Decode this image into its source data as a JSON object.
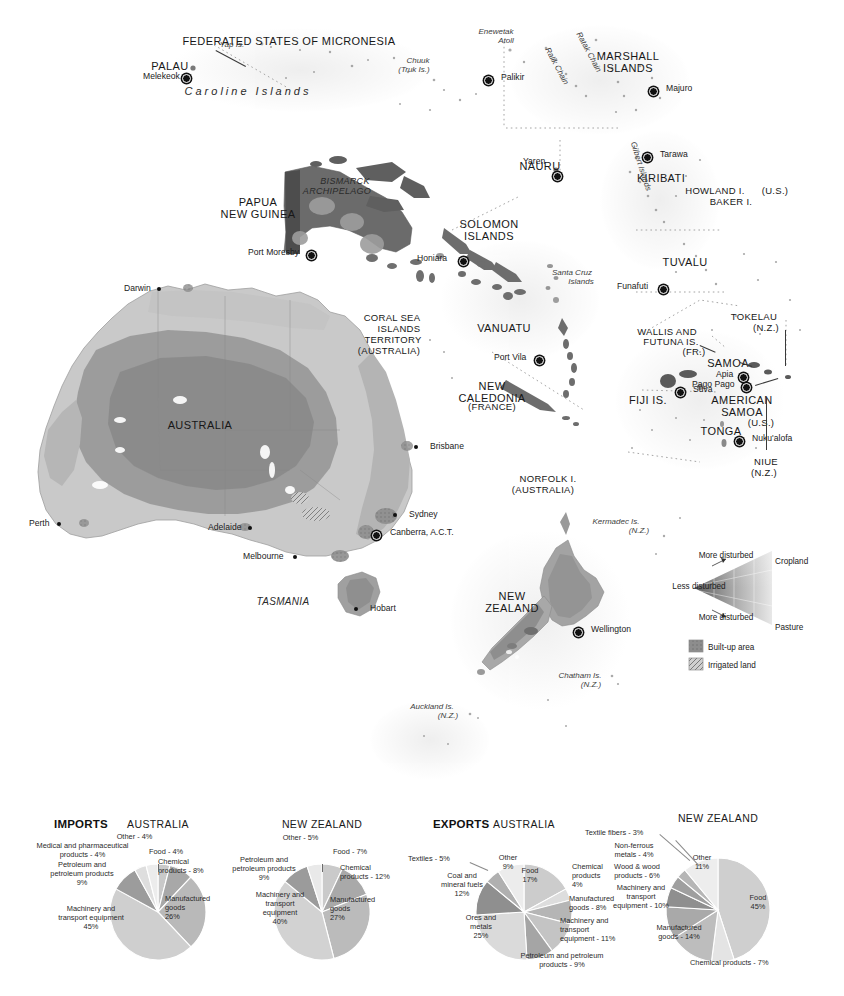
{
  "map": {
    "title": "Oceania reference map",
    "countries": [
      {
        "name": "PALAU",
        "x": 170,
        "y": 60,
        "cls": "country"
      },
      {
        "name": "FEDERATED STATES OF MICRONESIA",
        "x": 289,
        "y": 35,
        "cls": "country"
      },
      {
        "name": "MARSHALL ISLANDS",
        "x": 628,
        "y": 50,
        "cls": "country"
      },
      {
        "name": "NAURU",
        "x": 540,
        "y": 160,
        "cls": "country"
      },
      {
        "name": "KIRIBATI",
        "x": 661,
        "y": 172,
        "cls": "country"
      },
      {
        "name": "PAPUA NEW GUINEA",
        "x": 258,
        "y": 196,
        "cls": "country"
      },
      {
        "name": "SOLOMON ISLANDS",
        "x": 489,
        "y": 218,
        "cls": "country"
      },
      {
        "name": "TUVALU",
        "x": 685,
        "y": 256,
        "cls": "country"
      },
      {
        "name": "VANUATU",
        "x": 504,
        "y": 322,
        "cls": "country"
      },
      {
        "name": "SAMOA",
        "x": 728,
        "y": 357,
        "cls": "country"
      },
      {
        "name": "FIJI IS.",
        "x": 648,
        "y": 394,
        "cls": "country"
      },
      {
        "name": "AMERICAN SAMOA",
        "x": 742,
        "y": 394,
        "cls": "country"
      },
      {
        "name": "TONGA",
        "x": 721,
        "y": 425,
        "cls": "country"
      },
      {
        "name": "NEW CALEDONIA",
        "x": 492,
        "y": 380,
        "cls": "country"
      },
      {
        "name": "AUSTRALIA",
        "x": 200,
        "y": 419,
        "cls": "country"
      },
      {
        "name": "NEW ZEALAND",
        "x": 512,
        "y": 590,
        "cls": "country"
      }
    ],
    "sublabels": [
      {
        "name": "(FRANCE)",
        "x": 492,
        "y": 402
      },
      {
        "name": "(U.S.)",
        "x": 761,
        "y": 418
      }
    ],
    "territories": [
      {
        "name": "HOWLAND I.",
        "x": 715,
        "y": 186
      },
      {
        "name": "(U.S.)",
        "x": 775,
        "y": 186
      },
      {
        "name": "BAKER I.",
        "x": 731,
        "y": 197
      },
      {
        "name": "TOKELAU",
        "x": 754,
        "y": 312
      },
      {
        "name": "(N.Z.)",
        "x": 766,
        "y": 323
      },
      {
        "name": "WALLIS AND",
        "x": 667,
        "y": 327
      },
      {
        "name": "FUTUNA IS.",
        "x": 671,
        "y": 337
      },
      {
        "name": "(FR.)",
        "x": 694,
        "y": 347
      },
      {
        "name": "NIUE",
        "x": 766,
        "y": 457
      },
      {
        "name": "(N.Z.)",
        "x": 764,
        "y": 468
      },
      {
        "name": "CORAL SEA",
        "x": 392,
        "y": 313
      },
      {
        "name": "ISLANDS",
        "x": 399,
        "y": 324
      },
      {
        "name": "TERRITORY",
        "x": 393,
        "y": 335
      },
      {
        "name": "(AUSTRALIA)",
        "x": 389,
        "y": 346
      },
      {
        "name": "NORFOLK I.",
        "x": 548,
        "y": 474
      },
      {
        "name": "(AUSTRALIA)",
        "x": 543,
        "y": 485
      }
    ],
    "cities": [
      {
        "name": "Melekeok",
        "x": 182,
        "y": 74,
        "dx": 39,
        "dy": 4,
        "type": "capital",
        "align": "right"
      },
      {
        "name": "Palikir",
        "x": 484,
        "y": 76,
        "dx": -7,
        "dy": 3,
        "type": "capital",
        "align": "left"
      },
      {
        "name": "Majuro",
        "x": 649,
        "y": 87,
        "dx": -7,
        "dy": 3,
        "type": "capital",
        "align": "left"
      },
      {
        "name": "Yaren",
        "x": 553,
        "y": 172,
        "dx": 30,
        "dy": -9,
        "type": "capital",
        "align": "right"
      },
      {
        "name": "Tarawa",
        "x": 643,
        "y": 153,
        "dx": -7,
        "dy": 3,
        "type": "capital",
        "align": "left"
      },
      {
        "name": "Port Moresby",
        "x": 307,
        "y": 251,
        "dx": 59,
        "dy": 3,
        "type": "capital",
        "align": "right"
      },
      {
        "name": "Honiara",
        "x": 459,
        "y": 257,
        "dx": 42,
        "dy": 3,
        "type": "capital",
        "align": "right"
      },
      {
        "name": "Funafuti",
        "x": 659,
        "y": 285,
        "dx": 42,
        "dy": 3,
        "type": "capital",
        "align": "right"
      },
      {
        "name": "Port Vila",
        "x": 535,
        "y": 356,
        "dx": 41,
        "dy": 3,
        "type": "capital",
        "align": "right"
      },
      {
        "name": "Suva",
        "x": 676,
        "y": 388,
        "dx": -7,
        "dy": 3,
        "type": "capital",
        "align": "left"
      },
      {
        "name": "Apia",
        "x": 739,
        "y": 373,
        "dx": 23,
        "dy": 3,
        "type": "capital",
        "align": "right"
      },
      {
        "name": "Pago Pago",
        "x": 742,
        "y": 383,
        "dx": 50,
        "dy": 3,
        "type": "capital",
        "align": "right"
      },
      {
        "name": "Nuku'alofa",
        "x": 735,
        "y": 437,
        "dx": -7,
        "dy": 3,
        "type": "capital",
        "align": "left"
      },
      {
        "name": "Wellington",
        "x": 574,
        "y": 628,
        "dx": -7,
        "dy": 3,
        "type": "capital",
        "align": "left"
      },
      {
        "name": "Darwin",
        "x": 157,
        "y": 287,
        "dx": 33,
        "dy": 3,
        "type": "city",
        "align": "right"
      },
      {
        "name": "Brisbane",
        "x": 414,
        "y": 445,
        "dx": -6,
        "dy": 3,
        "type": "city",
        "align": "left"
      },
      {
        "name": "Perth",
        "x": 57,
        "y": 522,
        "dx": 28,
        "dy": 3,
        "type": "city",
        "align": "right"
      },
      {
        "name": "Sydney",
        "x": 393,
        "y": 513,
        "dx": -6,
        "dy": 3,
        "type": "city",
        "align": "left"
      },
      {
        "name": "Adelaide",
        "x": 248,
        "y": 526,
        "dx": 40,
        "dy": 3,
        "type": "city",
        "align": "right"
      },
      {
        "name": "Canberra, A.C.T.",
        "x": 372,
        "y": 531,
        "dx": -8,
        "dy": 3,
        "type": "capital",
        "align": "left"
      },
      {
        "name": "Melbourne",
        "x": 293,
        "y": 555,
        "dx": 50,
        "dy": 3,
        "type": "city",
        "align": "right"
      },
      {
        "name": "Hobart",
        "x": 354,
        "y": 607,
        "dx": -6,
        "dy": 3,
        "type": "city",
        "align": "left"
      }
    ],
    "physical": [
      {
        "name": "Yap Is.",
        "x": 232,
        "y": 41,
        "cls": "isl"
      },
      {
        "name": "Chuuk",
        "x": 418,
        "y": 57,
        "cls": "isl"
      },
      {
        "name": "(Truk Is.)",
        "x": 414,
        "y": 66,
        "cls": "isl"
      },
      {
        "name": "Enewetak",
        "x": 496,
        "y": 28,
        "cls": "isl"
      },
      {
        "name": "Atoll",
        "x": 506,
        "y": 37,
        "cls": "isl"
      },
      {
        "name": "Caroline Islands",
        "x": 248,
        "y": 85,
        "cls": "isl-b"
      },
      {
        "name": "Ralik Chain",
        "x": 556,
        "y": 62,
        "cls": "isl"
      },
      {
        "name": "Ratak Chain",
        "x": 588,
        "y": 48,
        "cls": "isl"
      },
      {
        "name": "Gilbert Islands",
        "x": 640,
        "y": 162,
        "cls": "isl"
      },
      {
        "name": "BISMARCK",
        "x": 345,
        "y": 176,
        "cls": "isl-b"
      },
      {
        "name": "ARCHIPELAGO",
        "x": 337,
        "y": 186,
        "cls": "isl-b"
      },
      {
        "name": "Santa Cruz",
        "x": 572,
        "y": 269,
        "cls": "isl"
      },
      {
        "name": "Islands",
        "x": 581,
        "y": 278,
        "cls": "isl"
      },
      {
        "name": "TASMANIA",
        "x": 283,
        "y": 596,
        "cls": "isl-b"
      },
      {
        "name": "Kermadec Is.",
        "x": 616,
        "y": 518,
        "cls": "isl"
      },
      {
        "name": "(N.Z.)",
        "x": 639,
        "y": 527,
        "cls": "isl"
      },
      {
        "name": "Chatham Is.",
        "x": 580,
        "y": 672,
        "cls": "isl"
      },
      {
        "name": "(N.Z.)",
        "x": 591,
        "y": 681,
        "cls": "isl"
      },
      {
        "name": "Auckland Is.",
        "x": 432,
        "y": 703,
        "cls": "isl"
      },
      {
        "name": "(N.Z.)",
        "x": 448,
        "y": 712,
        "cls": "isl"
      }
    ],
    "legend": {
      "more_disturbed_top": "More\ndisturbed",
      "more_disturbed_bottom": "More\ndisturbed",
      "less_disturbed": "Less\ndisturbed",
      "cropland": "Cropland",
      "pasture": "Pasture",
      "swatches": [
        {
          "label": "Built-up area",
          "color": "#8d8d8d"
        },
        {
          "label": "Irrigated land",
          "color": "#bcbcbc"
        }
      ]
    }
  },
  "chart_data": [
    {
      "type": "pie",
      "title": "AUSTRALIA",
      "group": "IMPORTS",
      "cx": 158,
      "cy": 112,
      "r": 48,
      "start_angle": -90,
      "categories": [
        "Food - 4%",
        "Chemical products - 8%",
        "Manufactured goods 26%",
        "Machinery and transport equipment 45%",
        "Petroleum and petroleum products 9%",
        "Medical and pharmaceutical products - 4%",
        "Other - 4%"
      ],
      "values": [
        4,
        8,
        26,
        45,
        9,
        4,
        4
      ],
      "colors": [
        "#c9c9c9",
        "#a8a8a8",
        "#b9b9b9",
        "#cfcfcf",
        "#9c9c9c",
        "#dedede",
        "#ececec"
      ],
      "labels": [
        {
          "text": "Food - 4%",
          "x": 149,
          "y": 47,
          "w": 60,
          "align": "left"
        },
        {
          "text": "Chemical\nproducts - 8%",
          "x": 158,
          "y": 57,
          "w": 72,
          "align": "left"
        },
        {
          "text": "Manufactured\ngoods\n26%",
          "x": 165,
          "y": 94,
          "w": 70,
          "align": "left"
        },
        {
          "text": "Machinery and\ntransport equipment\n45%",
          "x": 36,
          "y": 104,
          "w": 110,
          "align": "center"
        },
        {
          "text": "Petroleum and\npetroleum products\n9%",
          "x": 30,
          "y": 60,
          "w": 104,
          "align": "center"
        },
        {
          "text": "Medical and pharmaceutical\nproducts - 4%",
          "x": 5,
          "y": 41,
          "w": 155,
          "align": "center"
        },
        {
          "text": "Other - 4%",
          "x": 102,
          "y": 32,
          "w": 65,
          "align": "center"
        }
      ]
    },
    {
      "type": "pie",
      "title": "NEW ZEALAND",
      "group": "IMPORTS",
      "cx": 322,
      "cy": 112,
      "r": 48,
      "start_angle": -90,
      "categories": [
        "Food - 7%",
        "Chemical products - 12%",
        "Manufactured goods 27%",
        "Machinery and transport equipment 40%",
        "Petroleum and petroleum products 9%",
        "Other - 5%"
      ],
      "values": [
        7,
        12,
        27,
        40,
        9,
        5
      ],
      "colors": [
        "#cacaca",
        "#a9a9a9",
        "#bbbbbb",
        "#d2d2d2",
        "#9b9b9b",
        "#e9e9e9"
      ],
      "labels": [
        {
          "text": "Food - 7%",
          "x": 333,
          "y": 47,
          "w": 60,
          "align": "left"
        },
        {
          "text": "Chemical\nproducts - 12%",
          "x": 340,
          "y": 63,
          "w": 76,
          "align": "left"
        },
        {
          "text": "Manufactured\ngoods\n27%",
          "x": 330,
          "y": 95,
          "w": 70,
          "align": "left"
        },
        {
          "text": "Machinery and\ntransport\nequipment\n40%",
          "x": 240,
          "y": 90,
          "w": 80,
          "align": "center"
        },
        {
          "text": "Petroleum and\npetroleum products\n9%",
          "x": 212,
          "y": 55,
          "w": 104,
          "align": "center"
        },
        {
          "text": "Other - 5%",
          "x": 268,
          "y": 33,
          "w": 65,
          "align": "center"
        }
      ]
    },
    {
      "type": "pie",
      "title": "AUSTRALIA",
      "group": "EXPORTS",
      "cx": 524,
      "cy": 112,
      "r": 48,
      "start_angle": -90,
      "categories": [
        "Food 17%",
        "Chemical products 4%",
        "Manufactured goods - 8%",
        "Machinery and transport equipment - 11%",
        "Petroleum and petroleum products - 9%",
        "Ores and metals 25%",
        "Coal and mineral fuels 12%",
        "Textiles - 5%",
        "Other 9%"
      ],
      "values": [
        17,
        4,
        8,
        11,
        9,
        25,
        12,
        5,
        9
      ],
      "colors": [
        "#cccccc",
        "#dddddd",
        "#b5b5b5",
        "#c4c4c4",
        "#a5a5a5",
        "#dadada",
        "#8f8f8f",
        "#b0b0b0",
        "#ececec"
      ],
      "labels": [
        {
          "text": "Food\n17%",
          "x": 508,
          "y": 66,
          "w": 44,
          "align": "center"
        },
        {
          "text": "Chemical\nproducts\n4%",
          "x": 572,
          "y": 62,
          "w": 58,
          "align": "left"
        },
        {
          "text": "Manufactured\ngoods - 8%",
          "x": 569,
          "y": 94,
          "w": 78,
          "align": "left"
        },
        {
          "text": "Machinery and\ntransport\nequipment - 11%",
          "x": 560,
          "y": 116,
          "w": 86,
          "align": "left"
        },
        {
          "text": "Petroleum and petroleum\nproducts - 9%",
          "x": 497,
          "y": 151,
          "w": 130,
          "align": "center"
        },
        {
          "text": "Ores and\nmetals\n25%",
          "x": 450,
          "y": 113,
          "w": 62,
          "align": "center"
        },
        {
          "text": "Coal and\nmineral fuels\n12%",
          "x": 424,
          "y": 71,
          "w": 76,
          "align": "center"
        },
        {
          "text": "Textiles - 5%",
          "x": 408,
          "y": 54,
          "w": 62,
          "align": "left"
        },
        {
          "text": "Other\n9%",
          "x": 487,
          "y": 53,
          "w": 42,
          "align": "center"
        }
      ]
    },
    {
      "type": "pie",
      "title": "NEW ZEALAND",
      "group": "EXPORTS",
      "cx": 718,
      "cy": 110,
      "r": 52,
      "start_angle": -90,
      "categories": [
        "Food 45%",
        "Chemical products - 7%",
        "Manufactured goods - 14%",
        "Machinery and transport equipment - 10%",
        "Wood & wood products - 6%",
        "Non-ferrous metals - 4%",
        "Textile fibers - 3%",
        "Other 11%"
      ],
      "values": [
        45,
        7,
        14,
        10,
        6,
        4,
        3,
        11
      ],
      "colors": [
        "#cfcfcf",
        "#e4e4e4",
        "#bdbdbd",
        "#a9a9a9",
        "#8f8f8f",
        "#9f9f9f",
        "#b6b6b6",
        "#ededed"
      ],
      "labels": [
        {
          "text": "Food\n45%",
          "x": 736,
          "y": 93,
          "w": 44,
          "align": "center"
        },
        {
          "text": "Chemical products - 7%",
          "x": 690,
          "y": 158,
          "w": 130,
          "align": "left"
        },
        {
          "text": "Manufactured\ngoods - 14%",
          "x": 639,
          "y": 123,
          "w": 80,
          "align": "center"
        },
        {
          "text": "Machinery and\ntransport\nequipment - 10%",
          "x": 596,
          "y": 83,
          "w": 90,
          "align": "center"
        },
        {
          "text": "Wood & wood\nproducts - 6%",
          "x": 597,
          "y": 62,
          "w": 80,
          "align": "center"
        },
        {
          "text": "Non-ferrous\nmetals - 4%",
          "x": 598,
          "y": 41,
          "w": 72,
          "align": "center"
        },
        {
          "text": "Textile fibers - 3%",
          "x": 585,
          "y": 28,
          "w": 86,
          "align": "left"
        },
        {
          "text": "Other\n11%",
          "x": 680,
          "y": 53,
          "w": 44,
          "align": "center"
        }
      ]
    }
  ],
  "sections": {
    "imports": "IMPORTS",
    "exports": "EXPORTS"
  }
}
